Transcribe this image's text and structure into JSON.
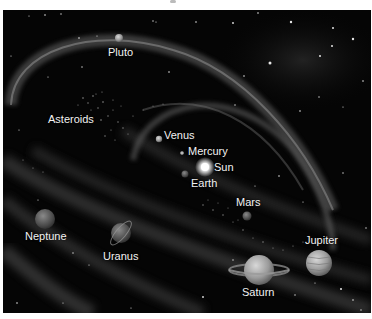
{
  "figure": {
    "background_color": "#050505",
    "label_color": "#f2f2f2",
    "bodies": [
      {
        "name": "Pluto",
        "label": "Pluto"
      },
      {
        "name": "Asteroids",
        "label": "Asteroids"
      },
      {
        "name": "Venus",
        "label": "Venus"
      },
      {
        "name": "Mercury",
        "label": "Mercury"
      },
      {
        "name": "Sun",
        "label": "Sun"
      },
      {
        "name": "Earth",
        "label": "Earth"
      },
      {
        "name": "Mars",
        "label": "Mars"
      },
      {
        "name": "Neptune",
        "label": "Neptune"
      },
      {
        "name": "Uranus",
        "label": "Uranus"
      },
      {
        "name": "Jupiter",
        "label": "Jupiter"
      },
      {
        "name": "Saturn",
        "label": "Saturn"
      }
    ]
  }
}
